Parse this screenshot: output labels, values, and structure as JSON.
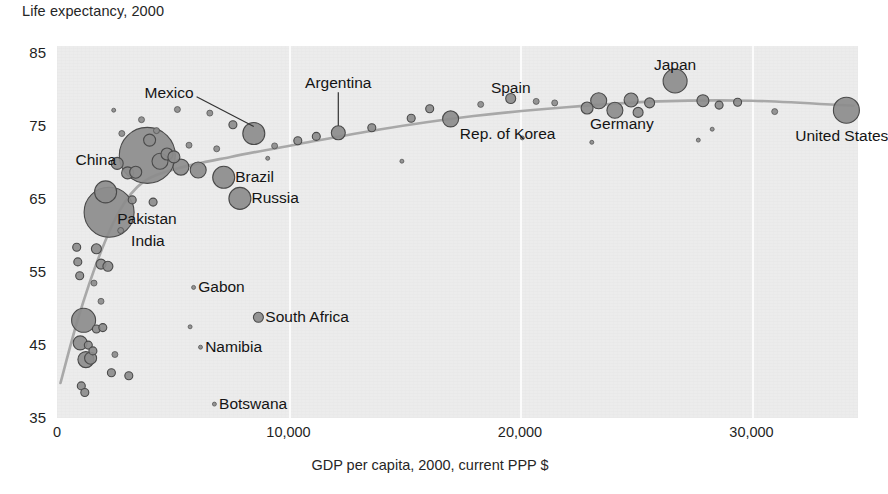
{
  "chart_data": {
    "type": "scatter",
    "title": "Life expectancy, 2000",
    "xlabel": "GDP per capita, 2000, current PPP $",
    "ylabel": "Life expectancy, 2000",
    "xlim": [
      0,
      34600
    ],
    "ylim": [
      35,
      86
    ],
    "xticks": [
      0,
      10000,
      20000,
      30000
    ],
    "xticklabels": [
      "0",
      "10,000",
      "20,000",
      "30,000"
    ],
    "yticks": [
      35,
      45,
      55,
      65,
      75,
      85
    ],
    "yticklabels": [
      "35",
      "45",
      "55",
      "65",
      "75",
      "85"
    ],
    "grid": "vertical",
    "legend": "none",
    "bubble_encoding": "population",
    "marker_color": "#8c8c8c",
    "marker_edge_color": "#4a4a4a",
    "trend_line_color": "#a8a8a8",
    "plot_background": "#ececec",
    "labels": [
      {
        "name": "China",
        "x": 3900,
        "y": 71.0,
        "text_x": 2550,
        "text_y": 70.4,
        "align": "right"
      },
      {
        "name": "Mexico",
        "x": 8500,
        "y": 74.0,
        "text_x": 5900,
        "text_y": 79.6,
        "align": "right",
        "leader": true
      },
      {
        "name": "Argentina",
        "x": 12150,
        "y": 74.1,
        "text_x": 12150,
        "text_y": 80.9,
        "align": "center",
        "leader": true
      },
      {
        "name": "Spain",
        "x": 19600,
        "y": 78.8,
        "text_x": 19600,
        "text_y": 80.3,
        "align": "center"
      },
      {
        "name": "Japan",
        "x": 26700,
        "y": 81.2,
        "text_x": 26700,
        "text_y": 83.4,
        "align": "center"
      },
      {
        "name": "Germany",
        "x": 24100,
        "y": 78.1,
        "text_x": 24400,
        "text_y": 75.3,
        "align": "center"
      },
      {
        "name": "Rep. of Korea",
        "x": 17000,
        "y": 76.0,
        "text_x": 17400,
        "text_y": 73.9,
        "align": "left"
      },
      {
        "name": "United States",
        "x": 34100,
        "y": 77.2,
        "text_x": 33900,
        "text_y": 73.6,
        "align": "center"
      },
      {
        "name": "Brazil",
        "x": 7200,
        "y": 68.0,
        "text_x": 7700,
        "text_y": 68.0,
        "align": "left"
      },
      {
        "name": "Russia",
        "x": 7900,
        "y": 65.1,
        "text_x": 8400,
        "text_y": 65.1,
        "align": "left"
      },
      {
        "name": "Pakistan",
        "x": 2100,
        "y": 63.1,
        "text_x": 2600,
        "text_y": 62.3,
        "align": "left"
      },
      {
        "name": "India",
        "x": 2400,
        "y": 62.5,
        "text_x": 3200,
        "text_y": 59.2,
        "align": "left"
      },
      {
        "name": "Gabon",
        "x": 5900,
        "y": 52.9,
        "text_x": 6100,
        "text_y": 52.9,
        "align": "left"
      },
      {
        "name": "South Africa",
        "x": 8700,
        "y": 48.8,
        "text_x": 9000,
        "text_y": 48.8,
        "align": "left"
      },
      {
        "name": "Namibia",
        "x": 6200,
        "y": 44.7,
        "text_x": 6400,
        "text_y": 44.7,
        "align": "left"
      },
      {
        "name": "Botswana",
        "x": 6800,
        "y": 36.9,
        "text_x": 7000,
        "text_y": 36.9,
        "align": "left"
      }
    ],
    "points": [
      {
        "x": 3900,
        "y": 71.0,
        "r": 28
      },
      {
        "x": 2250,
        "y": 63.2,
        "r": 25
      },
      {
        "x": 1150,
        "y": 48.4,
        "r": 12
      },
      {
        "x": 2100,
        "y": 66.0,
        "r": 11
      },
      {
        "x": 8500,
        "y": 74.0,
        "r": 11
      },
      {
        "x": 7200,
        "y": 68.0,
        "r": 11
      },
      {
        "x": 7900,
        "y": 65.1,
        "r": 11
      },
      {
        "x": 26700,
        "y": 81.2,
        "r": 12
      },
      {
        "x": 34100,
        "y": 77.2,
        "r": 13
      },
      {
        "x": 5350,
        "y": 69.4,
        "r": 8
      },
      {
        "x": 4450,
        "y": 70.2,
        "r": 8
      },
      {
        "x": 6100,
        "y": 69.0,
        "r": 8
      },
      {
        "x": 17000,
        "y": 76.0,
        "r": 8
      },
      {
        "x": 23400,
        "y": 78.5,
        "r": 8
      },
      {
        "x": 24100,
        "y": 77.2,
        "r": 8
      },
      {
        "x": 24800,
        "y": 78.6,
        "r": 7
      },
      {
        "x": 1000,
        "y": 45.3,
        "r": 7
      },
      {
        "x": 1250,
        "y": 43.0,
        "r": 8
      },
      {
        "x": 1450,
        "y": 43.2,
        "r": 6
      },
      {
        "x": 2600,
        "y": 69.9,
        "r": 6
      },
      {
        "x": 3050,
        "y": 68.6,
        "r": 6
      },
      {
        "x": 3400,
        "y": 68.7,
        "r": 6
      },
      {
        "x": 4000,
        "y": 73.1,
        "r": 6
      },
      {
        "x": 4750,
        "y": 71.2,
        "r": 6
      },
      {
        "x": 5050,
        "y": 70.8,
        "r": 6
      },
      {
        "x": 12150,
        "y": 74.1,
        "r": 7
      },
      {
        "x": 19600,
        "y": 78.8,
        "r": 5
      },
      {
        "x": 8700,
        "y": 48.8,
        "r": 5
      },
      {
        "x": 1700,
        "y": 58.2,
        "r": 5
      },
      {
        "x": 1900,
        "y": 56.1,
        "r": 5
      },
      {
        "x": 2200,
        "y": 55.8,
        "r": 5
      },
      {
        "x": 900,
        "y": 56.4,
        "r": 4
      },
      {
        "x": 850,
        "y": 58.4,
        "r": 4
      },
      {
        "x": 980,
        "y": 54.5,
        "r": 4
      },
      {
        "x": 1700,
        "y": 47.2,
        "r": 4
      },
      {
        "x": 1980,
        "y": 47.4,
        "r": 4
      },
      {
        "x": 1350,
        "y": 45.0,
        "r": 4
      },
      {
        "x": 1550,
        "y": 44.2,
        "r": 4
      },
      {
        "x": 2350,
        "y": 41.2,
        "r": 4
      },
      {
        "x": 1050,
        "y": 39.4,
        "r": 4
      },
      {
        "x": 1200,
        "y": 38.5,
        "r": 4
      },
      {
        "x": 27900,
        "y": 78.5,
        "r": 6
      },
      {
        "x": 25600,
        "y": 78.2,
        "r": 5
      },
      {
        "x": 22900,
        "y": 77.5,
        "r": 6
      },
      {
        "x": 25100,
        "y": 76.9,
        "r": 5
      },
      {
        "x": 28600,
        "y": 77.9,
        "r": 4
      },
      {
        "x": 29400,
        "y": 78.3,
        "r": 4
      },
      {
        "x": 31000,
        "y": 77.0,
        "r": 3
      },
      {
        "x": 11200,
        "y": 73.6,
        "r": 4
      },
      {
        "x": 13600,
        "y": 74.8,
        "r": 4
      },
      {
        "x": 15300,
        "y": 76.1,
        "r": 4
      },
      {
        "x": 16100,
        "y": 77.4,
        "r": 4
      },
      {
        "x": 18300,
        "y": 78.0,
        "r": 3
      },
      {
        "x": 20700,
        "y": 78.4,
        "r": 3
      },
      {
        "x": 21500,
        "y": 78.2,
        "r": 3
      },
      {
        "x": 6600,
        "y": 76.8,
        "r": 3
      },
      {
        "x": 5200,
        "y": 77.3,
        "r": 3
      },
      {
        "x": 7600,
        "y": 75.2,
        "r": 4
      },
      {
        "x": 9400,
        "y": 72.3,
        "r": 3
      },
      {
        "x": 10400,
        "y": 73.0,
        "r": 4
      },
      {
        "x": 3650,
        "y": 75.9,
        "r": 3
      },
      {
        "x": 4300,
        "y": 74.4,
        "r": 3
      },
      {
        "x": 6900,
        "y": 71.9,
        "r": 3
      },
      {
        "x": 5700,
        "y": 72.4,
        "r": 3
      },
      {
        "x": 2800,
        "y": 74.0,
        "r": 3
      },
      {
        "x": 3250,
        "y": 64.9,
        "r": 4
      },
      {
        "x": 4150,
        "y": 64.6,
        "r": 4
      },
      {
        "x": 2750,
        "y": 60.7,
        "r": 3
      },
      {
        "x": 1600,
        "y": 53.5,
        "r": 3
      },
      {
        "x": 1900,
        "y": 51.0,
        "r": 3
      },
      {
        "x": 2500,
        "y": 43.7,
        "r": 3
      },
      {
        "x": 3100,
        "y": 40.8,
        "r": 4
      },
      {
        "x": 5900,
        "y": 52.9,
        "r": 2
      },
      {
        "x": 6200,
        "y": 44.7,
        "r": 2
      },
      {
        "x": 6800,
        "y": 36.9,
        "r": 2
      },
      {
        "x": 5750,
        "y": 47.5,
        "r": 2
      },
      {
        "x": 14900,
        "y": 70.2,
        "r": 2
      },
      {
        "x": 23100,
        "y": 72.8,
        "r": 2
      },
      {
        "x": 27700,
        "y": 73.1,
        "r": 2
      },
      {
        "x": 28300,
        "y": 74.6,
        "r": 2
      },
      {
        "x": 20100,
        "y": 73.4,
        "r": 2
      },
      {
        "x": 9100,
        "y": 70.6,
        "r": 2
      },
      {
        "x": 2450,
        "y": 77.2,
        "r": 2
      }
    ],
    "trend_line": [
      {
        "x": 150,
        "y": 39.8
      },
      {
        "x": 900,
        "y": 48.5
      },
      {
        "x": 1800,
        "y": 57.0
      },
      {
        "x": 2700,
        "y": 63.4
      },
      {
        "x": 3700,
        "y": 67.3
      },
      {
        "x": 5200,
        "y": 69.2
      },
      {
        "x": 7500,
        "y": 70.8
      },
      {
        "x": 10500,
        "y": 72.6
      },
      {
        "x": 14000,
        "y": 74.6
      },
      {
        "x": 18000,
        "y": 76.4
      },
      {
        "x": 22000,
        "y": 77.6
      },
      {
        "x": 26000,
        "y": 78.4
      },
      {
        "x": 30000,
        "y": 78.5
      },
      {
        "x": 34400,
        "y": 77.8
      }
    ]
  }
}
